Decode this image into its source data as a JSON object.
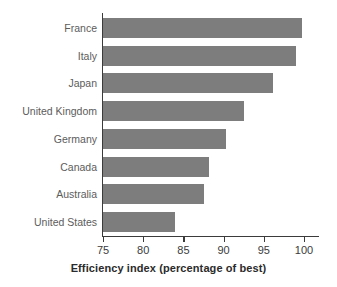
{
  "chart_data": {
    "type": "bar",
    "orientation": "horizontal",
    "title": "",
    "xlabel": "Efficiency index (percentage of best)",
    "ylabel": "",
    "xlim": [
      75,
      100
    ],
    "xticks": [
      75,
      80,
      85,
      90,
      95,
      100
    ],
    "xtick_labels": [
      "75",
      "80",
      "85",
      "90",
      "95",
      "100"
    ],
    "grid": false,
    "legend": null,
    "bar_color": "#7d7d7d",
    "background_color": "#ffffff",
    "axis_color": "#3b3b3b",
    "label_color": "#5c5c5c",
    "categories": [
      "France",
      "Italy",
      "Japan",
      "United Kingdom",
      "Germany",
      "Canada",
      "Australia",
      "United States"
    ],
    "values": [
      99.7,
      99.0,
      96.1,
      92.5,
      90.3,
      88.2,
      87.6,
      84.0
    ]
  }
}
